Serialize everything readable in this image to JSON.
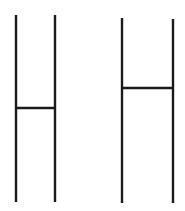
{
  "canvas": {
    "width": 185,
    "height": 211,
    "background": "#ffffff",
    "stroke_color": "#1a1a1a"
  },
  "figures": [
    {
      "name": "left-h-figure",
      "left_post": {
        "x": 16,
        "y1": 15,
        "y2": 202
      },
      "right_post": {
        "x": 55,
        "y1": 15,
        "y2": 202
      },
      "crossbar": {
        "x1": 16,
        "x2": 55,
        "y": 108
      }
    },
    {
      "name": "right-h-figure",
      "left_post": {
        "x": 122,
        "y1": 18,
        "y2": 203
      },
      "right_post": {
        "x": 173,
        "y1": 19,
        "y2": 203
      },
      "crossbar": {
        "x1": 122,
        "x2": 173,
        "y": 88
      }
    }
  ]
}
